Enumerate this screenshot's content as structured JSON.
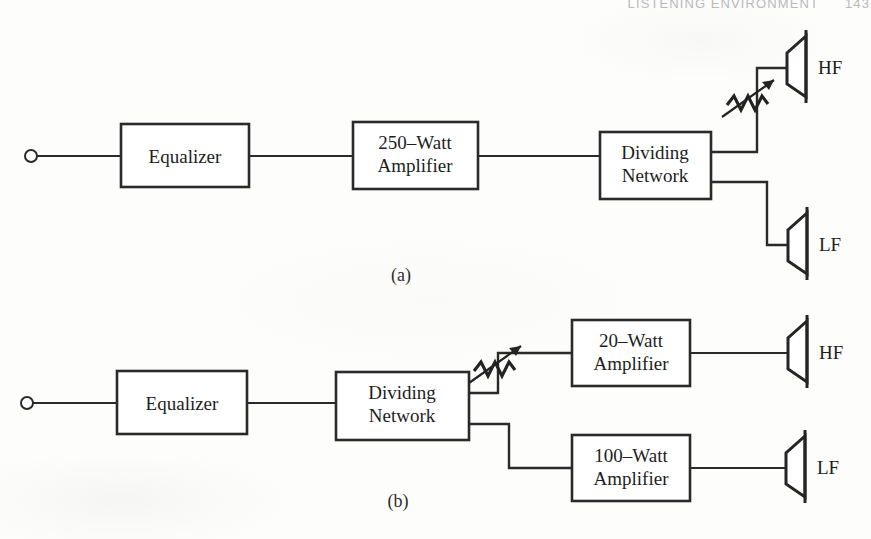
{
  "page": {
    "running_head": "LISTENING ENVIRONMENT",
    "page_number": "143",
    "background_color": "#fdfdfc",
    "ink_color": "#2a2a2a"
  },
  "figure": {
    "captions": {
      "a": "(a)",
      "b": "(b)"
    },
    "diagram_a": {
      "caption": "(a)",
      "input_terminal": "input-terminal",
      "blocks": [
        {
          "id": "equalizer",
          "line1": "Equalizer",
          "line2": ""
        },
        {
          "id": "power-amplifier",
          "line1": "250–Watt",
          "line2": "Amplifier"
        },
        {
          "id": "dividing-network",
          "line1": "Dividing",
          "line2": "Network"
        }
      ],
      "attenuator": "variable-attenuator",
      "speakers": [
        {
          "id": "hf-speaker",
          "label": "HF"
        },
        {
          "id": "lf-speaker",
          "label": "LF"
        }
      ]
    },
    "diagram_b": {
      "caption": "(b)",
      "input_terminal": "input-terminal",
      "blocks": [
        {
          "id": "equalizer",
          "line1": "Equalizer",
          "line2": ""
        },
        {
          "id": "dividing-network",
          "line1": "Dividing",
          "line2": "Network"
        },
        {
          "id": "hf-amplifier",
          "line1": "20–Watt",
          "line2": "Amplifier"
        },
        {
          "id": "lf-amplifier",
          "line1": "100–Watt",
          "line2": "Amplifier"
        }
      ],
      "attenuator": "variable-attenuator",
      "speakers": [
        {
          "id": "hf-speaker",
          "label": "HF"
        },
        {
          "id": "lf-speaker",
          "label": "LF"
        }
      ]
    }
  }
}
